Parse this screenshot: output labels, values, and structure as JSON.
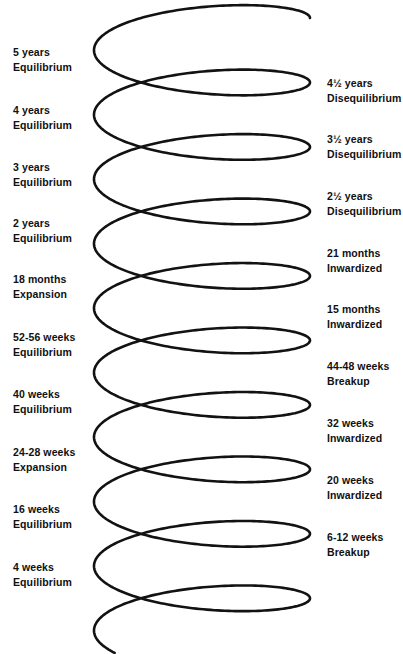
{
  "figure": {
    "type": "diagram",
    "subtype": "helix-spiral",
    "stroke_color": "#121212",
    "background_color": "#ffffff",
    "text_color": "#101010"
  },
  "left_labels": [
    {
      "age": "5 years",
      "stage": "Equilibrium",
      "y": 45
    },
    {
      "age": "4 years",
      "stage": "Equilibrium",
      "y": 103
    },
    {
      "age": "3 years",
      "stage": "Equilibrium",
      "y": 160
    },
    {
      "age": "2 years",
      "stage": "Equilibrium",
      "y": 216
    },
    {
      "age": "18 months",
      "stage": "Expansion",
      "y": 272
    },
    {
      "age": "52-56 weeks",
      "stage": "Equilibrium",
      "y": 330
    },
    {
      "age": "40 weeks",
      "stage": "Equilibrium",
      "y": 387
    },
    {
      "age": "24-28 weeks",
      "stage": "Expansion",
      "y": 445
    },
    {
      "age": "16 weeks",
      "stage": "Equilibrium",
      "y": 502
    },
    {
      "age": "4 weeks",
      "stage": "Equilibrium",
      "y": 560
    }
  ],
  "right_labels": [
    {
      "age": "4½ years",
      "stage": "Disequilibrium",
      "y": 76
    },
    {
      "age": "3½ years",
      "stage": "Disequilibrium",
      "y": 132
    },
    {
      "age": "2½ years",
      "stage": "Disequilibrium",
      "y": 189
    },
    {
      "age": "21 months",
      "stage": "Inwardized",
      "y": 246
    },
    {
      "age": "15 months",
      "stage": "Inwardized",
      "y": 302
    },
    {
      "age": "44-48 weeks",
      "stage": "Breakup",
      "y": 359
    },
    {
      "age": "32 weeks",
      "stage": "Inwardized",
      "y": 416
    },
    {
      "age": "20 weeks",
      "stage": "Inwardized",
      "y": 473
    },
    {
      "age": "6-12 weeks",
      "stage": "Breakup",
      "y": 530
    }
  ],
  "helix": {
    "center_x": 202,
    "radius_x": 108,
    "radius_y": 27,
    "top_y": 18,
    "bottom_y": 637,
    "turns": 9.6,
    "stroke_width": 2.6,
    "start_point": {
      "x": 205,
      "y": 17
    },
    "end_point": {
      "x": 205,
      "y": 637
    }
  }
}
